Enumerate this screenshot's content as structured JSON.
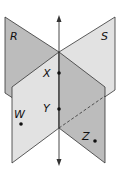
{
  "diagram": {
    "colors": {
      "plane_dark": "#bcbcbc",
      "plane_light": "#e2e2e2",
      "stroke": "#333333",
      "point": "#111111"
    },
    "planes": [
      {
        "name": "R",
        "label": "R"
      },
      {
        "name": "S",
        "label": "S"
      }
    ],
    "points": [
      {
        "name": "X",
        "label": "X"
      },
      {
        "name": "Y",
        "label": "Y"
      },
      {
        "name": "W",
        "label": "W"
      },
      {
        "name": "Z",
        "label": "Z"
      }
    ],
    "line": {
      "description": "line of intersection through X and Y, arrows at both ends"
    }
  }
}
